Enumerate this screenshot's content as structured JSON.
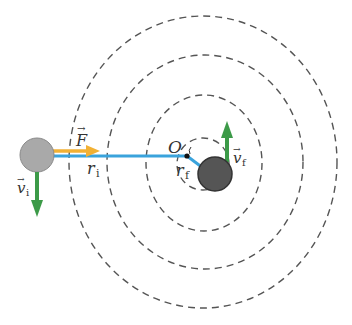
{
  "diagram": {
    "colors": {
      "orbit": "#555555",
      "radius_line": "#3aa3dc",
      "force_arrow": "#f2b134",
      "velocity_arrow": "#3c9a48",
      "initial_ball": "#a9a9a9",
      "final_ball": "#555555",
      "center_point": "#111111"
    },
    "labels": {
      "center": "O",
      "force": "F",
      "initial_radius": "r",
      "initial_radius_sub": "i",
      "final_radius": "r",
      "final_radius_sub": "f",
      "initial_velocity": "v",
      "initial_velocity_sub": "i",
      "final_velocity": "v",
      "final_velocity_sub": "f",
      "vector_mark": "→"
    }
  }
}
